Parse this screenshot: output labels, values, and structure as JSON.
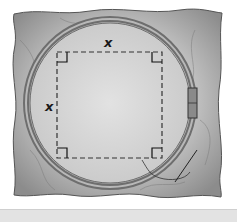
{
  "figure": {
    "labels": {
      "top_side": "x",
      "left_side": "x"
    },
    "colors": {
      "fabric": "#9a9a9a",
      "fabric_inner": "#d6d6d6",
      "hoop": "#8a8a8a",
      "dashed_line": "#333333",
      "bottom_strip": "#e3e3e3"
    }
  }
}
